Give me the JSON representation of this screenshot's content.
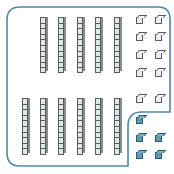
{
  "colors": {
    "border": "#4e8aa3",
    "block_light": "#dbe8ec",
    "block_outline": "#5a5a5a",
    "block_dark": "#5f9ab3",
    "block_dark_outline": "#2e5a6c"
  },
  "enclosed_group": {
    "rods_top_row": [
      {
        "x": 40,
        "y": 17,
        "h": 56
      },
      {
        "x": 58,
        "y": 17,
        "h": 56
      },
      {
        "x": 77,
        "y": 17,
        "h": 56
      },
      {
        "x": 95,
        "y": 17,
        "h": 56
      },
      {
        "x": 114,
        "y": 17,
        "h": 56
      }
    ],
    "rods_bottom_row": [
      {
        "x": 22,
        "y": 98,
        "h": 57
      },
      {
        "x": 40,
        "y": 98,
        "h": 57
      },
      {
        "x": 58,
        "y": 98,
        "h": 57
      },
      {
        "x": 77,
        "y": 98,
        "h": 57
      },
      {
        "x": 95,
        "y": 98,
        "h": 57
      },
      {
        "x": 114,
        "y": 98,
        "h": 57
      }
    ],
    "unit_cubes": [
      {
        "x": 136,
        "y": 17
      },
      {
        "x": 155,
        "y": 17
      },
      {
        "x": 136,
        "y": 34
      },
      {
        "x": 155,
        "y": 34
      },
      {
        "x": 136,
        "y": 52
      },
      {
        "x": 155,
        "y": 52
      },
      {
        "x": 136,
        "y": 70
      },
      {
        "x": 155,
        "y": 70
      },
      {
        "x": 136,
        "y": 96
      },
      {
        "x": 155,
        "y": 96
      }
    ],
    "counts": {
      "tens": 11,
      "ones": 10
    }
  },
  "outside_group": {
    "unit_cubes": [
      {
        "x": 136,
        "y": 117
      },
      {
        "x": 136,
        "y": 135
      },
      {
        "x": 155,
        "y": 135
      },
      {
        "x": 136,
        "y": 152
      },
      {
        "x": 155,
        "y": 152
      }
    ],
    "counts": {
      "ones": 5
    }
  }
}
